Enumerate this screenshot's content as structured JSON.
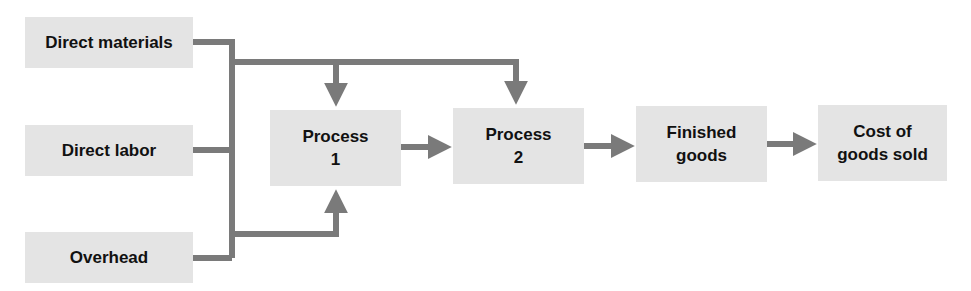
{
  "diagram": {
    "type": "flowchart",
    "colors": {
      "box_fill": "#e4e4e4",
      "connector": "#7a7a7a",
      "text": "#111111"
    },
    "inputs": [
      {
        "id": "direct-materials",
        "label": "Direct materials"
      },
      {
        "id": "direct-labor",
        "label": "Direct labor"
      },
      {
        "id": "overhead",
        "label": "Overhead"
      }
    ],
    "stages": [
      {
        "id": "process-1",
        "line1": "Process",
        "line2": "1"
      },
      {
        "id": "process-2",
        "line1": "Process",
        "line2": "2"
      },
      {
        "id": "finished-goods",
        "line1": "Finished",
        "line2": "goods"
      },
      {
        "id": "cost-of-goods-sold",
        "line1": "Cost of",
        "line2": "goods sold"
      }
    ],
    "edges": [
      {
        "from": "direct-materials",
        "to": "inputs-bus"
      },
      {
        "from": "direct-labor",
        "to": "inputs-bus"
      },
      {
        "from": "overhead",
        "to": "inputs-bus"
      },
      {
        "from": "inputs-bus",
        "to": "process-1",
        "side": "top"
      },
      {
        "from": "inputs-bus",
        "to": "process-2",
        "side": "top"
      },
      {
        "from": "inputs-bus",
        "to": "process-1",
        "side": "bottom"
      },
      {
        "from": "process-1",
        "to": "process-2"
      },
      {
        "from": "process-2",
        "to": "finished-goods"
      },
      {
        "from": "finished-goods",
        "to": "cost-of-goods-sold"
      }
    ]
  }
}
